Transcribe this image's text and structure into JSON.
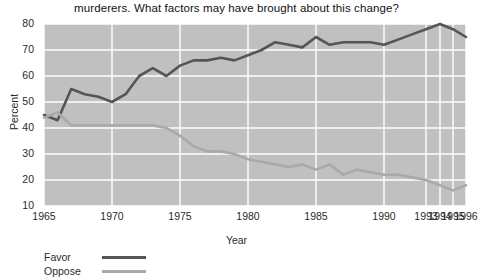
{
  "chart_data": {
    "type": "line",
    "title": "murderers. What factors may have brought about this change?",
    "xlabel": "Year",
    "ylabel": "Percent",
    "ylim": [
      10,
      80
    ],
    "yticks": [
      10,
      20,
      30,
      40,
      50,
      60,
      70,
      80
    ],
    "xticks": [
      "1965",
      "1970",
      "1975",
      "1980",
      "1985",
      "1990",
      "1993",
      "1994",
      "1995",
      "1996"
    ],
    "grid": true,
    "legend_position": "below-left",
    "plot_background": "#c0c0c0",
    "x": [
      1965,
      1966,
      1967,
      1968,
      1969,
      1970,
      1971,
      1972,
      1973,
      1974,
      1975,
      1976,
      1977,
      1978,
      1979,
      1980,
      1981,
      1982,
      1983,
      1984,
      1985,
      1986,
      1987,
      1988,
      1989,
      1990,
      1991,
      1992,
      1993,
      1994,
      1995,
      1996
    ],
    "series": [
      {
        "name": "Favor",
        "color": "#555555",
        "values": [
          45,
          43,
          55,
          53,
          52,
          50,
          53,
          60,
          63,
          60,
          64,
          66,
          66,
          67,
          66,
          68,
          70,
          73,
          72,
          71,
          75,
          72,
          73,
          73,
          73,
          72,
          74,
          76,
          78,
          80,
          78,
          75
        ]
      },
      {
        "name": "Oppose",
        "color": "#a9a9a9",
        "values": [
          44,
          46,
          41,
          41,
          41,
          41,
          41,
          41,
          41,
          40,
          37,
          33,
          31,
          31,
          30,
          28,
          27,
          26,
          25,
          26,
          24,
          26,
          22,
          24,
          23,
          22,
          22,
          21,
          20,
          18,
          16,
          18
        ]
      }
    ]
  }
}
